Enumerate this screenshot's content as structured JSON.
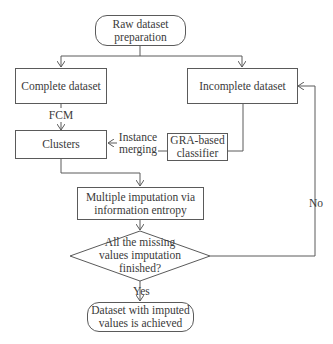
{
  "diagram": {
    "type": "flowchart",
    "nodes": {
      "start": {
        "shape": "rounded-rectangle",
        "line1": "Raw dataset",
        "line2": "preparation"
      },
      "complete": {
        "shape": "rectangle",
        "text": "Complete dataset"
      },
      "incomplete": {
        "shape": "rectangle",
        "text": "Incomplete dataset"
      },
      "clusters": {
        "shape": "rectangle",
        "text": "Clusters"
      },
      "classifier": {
        "shape": "rectangle",
        "line1": "GRA-based",
        "line2": "classifier"
      },
      "imputation": {
        "shape": "rectangle",
        "line1": "Multiple imputation via",
        "line2": "information entropy"
      },
      "decision": {
        "shape": "diamond",
        "line1": "All the missing",
        "line2": "values imputation",
        "line3": "finished?"
      },
      "end": {
        "shape": "rounded-rectangle",
        "line1": "Dataset with imputed",
        "line2": "values is achieved"
      }
    },
    "edge_labels": {
      "fcm": "FCM",
      "merge_line1": "Instance",
      "merge_line2": "merging",
      "yes": "Yes",
      "no": "No"
    },
    "edges": [
      {
        "from": "start",
        "to": "complete"
      },
      {
        "from": "start",
        "to": "incomplete"
      },
      {
        "from": "complete",
        "to": "clusters",
        "label": "FCM"
      },
      {
        "from": "incomplete",
        "to": "classifier"
      },
      {
        "from": "classifier",
        "to": "clusters",
        "label": "Instance merging"
      },
      {
        "from": "clusters",
        "to": "imputation"
      },
      {
        "from": "imputation",
        "to": "decision"
      },
      {
        "from": "decision",
        "to": "end",
        "label": "Yes"
      },
      {
        "from": "decision",
        "to": "incomplete",
        "label": "No"
      }
    ]
  }
}
